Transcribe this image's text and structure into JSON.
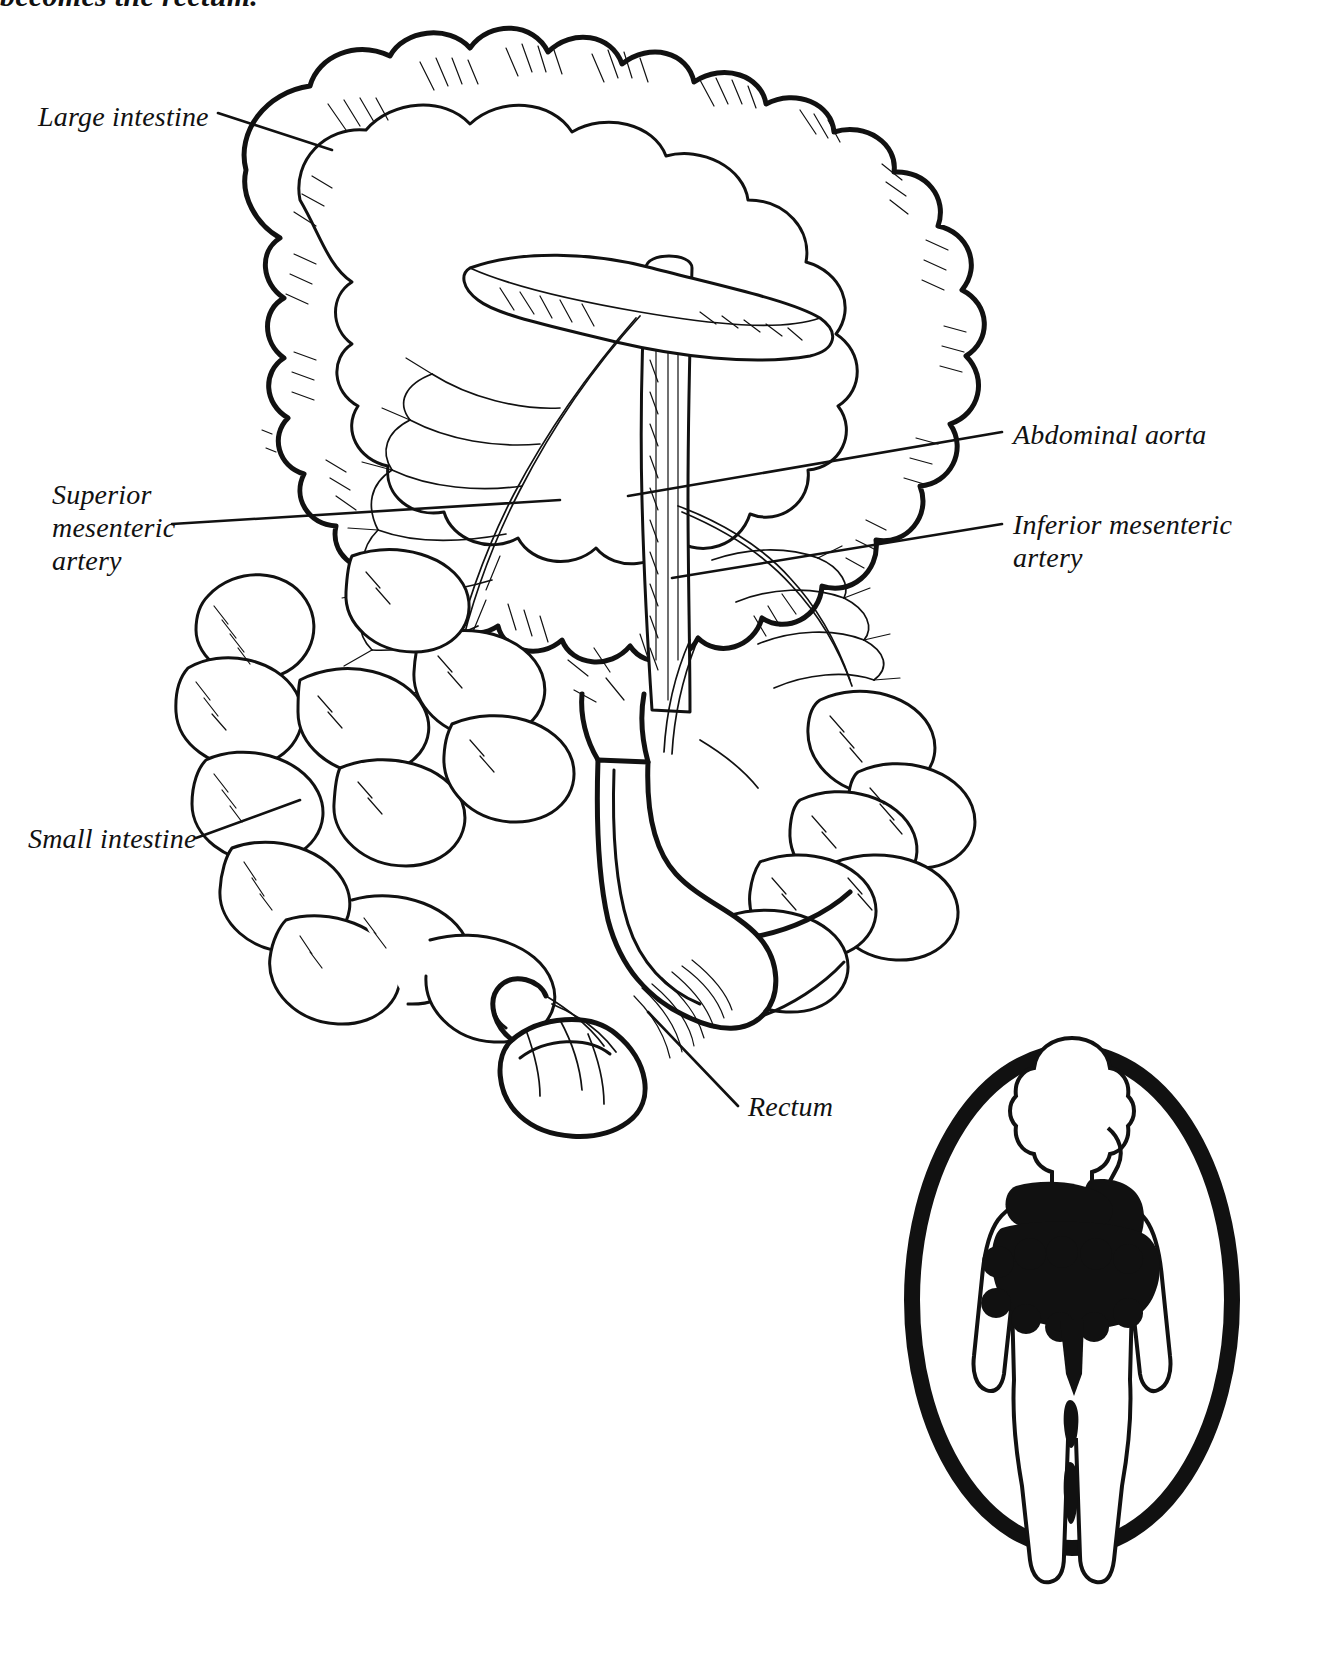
{
  "figure": {
    "kind": "anatomical-line-drawing",
    "caption_top": "becomes the rectum.",
    "labels": [
      {
        "id": "large-intestine",
        "text": "Large intestine",
        "x": 38,
        "y": 100,
        "align": "left"
      },
      {
        "id": "superior-mesenteric-artery",
        "text": "Superior\nmesenteric\nartery",
        "x": 52,
        "y": 478,
        "align": "left"
      },
      {
        "id": "small-intestine",
        "text": "Small intestine",
        "x": 28,
        "y": 822,
        "align": "left"
      },
      {
        "id": "abdominal-aorta",
        "text": "Abdominal aorta",
        "x": 1013,
        "y": 418,
        "align": "left"
      },
      {
        "id": "inferior-mesenteric-artery",
        "text": "Inferior mesenteric\nartery",
        "x": 1013,
        "y": 508,
        "align": "left"
      },
      {
        "id": "rectum",
        "text": "Rectum",
        "x": 748,
        "y": 1090,
        "align": "left"
      }
    ],
    "inset": {
      "name": "body-orientation-inset",
      "description": "Oval vignette showing a human body silhouette with the stomach, small intestine and colon filled solid black"
    },
    "colors": {
      "ink": "#111111",
      "paper": "#ffffff"
    }
  }
}
